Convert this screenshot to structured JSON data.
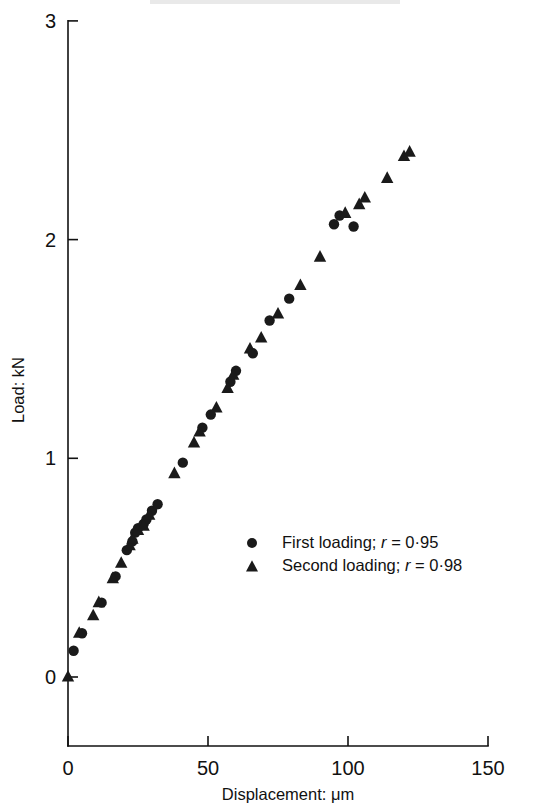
{
  "figure": {
    "background_color": "#ffffff",
    "marker_color": "#1a1a1a",
    "axis_color": "#111111"
  },
  "axes": {
    "x_title": "Displacement: μm",
    "y_title": "Load: kN",
    "x_ticks": [
      "0",
      "50",
      "100",
      "150"
    ],
    "y_ticks": [
      "0",
      "1",
      "2",
      "3"
    ]
  },
  "legend": {
    "entries": [
      {
        "marker": "circle-marker",
        "label": "First loading; ",
        "italic": "r",
        "value": " = 0·95"
      },
      {
        "marker": "triangle-marker",
        "label": "Second loading; ",
        "italic": "r",
        "value": " = 0·98"
      }
    ]
  },
  "chart_data": {
    "type": "scatter",
    "title": "",
    "xlabel": "Displacement: μm",
    "ylabel": "Load: kN",
    "xlim": [
      0,
      150
    ],
    "ylim": [
      0,
      3
    ],
    "xticks": [
      0,
      50,
      100,
      150
    ],
    "yticks": [
      0,
      1,
      2,
      3
    ],
    "grid": false,
    "legend_position": "inside-lower-right",
    "series": [
      {
        "name": "First loading; r = 0·95",
        "marker": "circle",
        "r": 0.95,
        "points": [
          [
            2,
            0.12
          ],
          [
            5,
            0.2
          ],
          [
            12,
            0.34
          ],
          [
            17,
            0.46
          ],
          [
            21,
            0.58
          ],
          [
            23,
            0.62
          ],
          [
            24,
            0.66
          ],
          [
            25,
            0.68
          ],
          [
            27,
            0.7
          ],
          [
            28,
            0.72
          ],
          [
            30,
            0.76
          ],
          [
            32,
            0.79
          ],
          [
            41,
            0.98
          ],
          [
            48,
            1.14
          ],
          [
            51,
            1.2
          ],
          [
            58,
            1.35
          ],
          [
            60,
            1.4
          ],
          [
            66,
            1.48
          ],
          [
            72,
            1.63
          ],
          [
            79,
            1.73
          ],
          [
            95,
            2.07
          ],
          [
            97,
            2.11
          ],
          [
            102,
            2.06
          ]
        ]
      },
      {
        "name": "Second loading; r = 0·98",
        "marker": "triangle",
        "r": 0.98,
        "points": [
          [
            0,
            0.0
          ],
          [
            4,
            0.2
          ],
          [
            9,
            0.28
          ],
          [
            11,
            0.34
          ],
          [
            16,
            0.45
          ],
          [
            19,
            0.52
          ],
          [
            22,
            0.6
          ],
          [
            23,
            0.63
          ],
          [
            25,
            0.67
          ],
          [
            27,
            0.69
          ],
          [
            29,
            0.74
          ],
          [
            38,
            0.93
          ],
          [
            45,
            1.07
          ],
          [
            47,
            1.12
          ],
          [
            53,
            1.23
          ],
          [
            57,
            1.32
          ],
          [
            59,
            1.38
          ],
          [
            65,
            1.5
          ],
          [
            69,
            1.55
          ],
          [
            75,
            1.66
          ],
          [
            83,
            1.79
          ],
          [
            90,
            1.92
          ],
          [
            99,
            2.12
          ],
          [
            104,
            2.16
          ],
          [
            106,
            2.19
          ],
          [
            114,
            2.28
          ],
          [
            120,
            2.38
          ],
          [
            122,
            2.4
          ]
        ]
      }
    ]
  }
}
